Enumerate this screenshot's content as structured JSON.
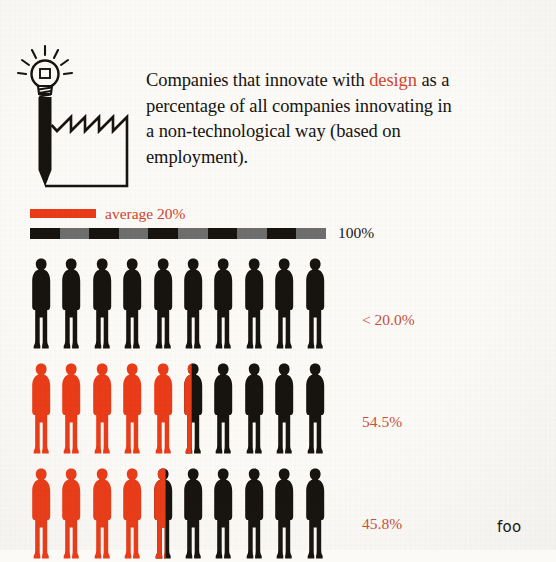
{
  "headline": {
    "part1": "Companies that innovate with ",
    "accent": "design",
    "part2": " as a percentage of all companies innovating in a non-technological way (based on employment)."
  },
  "logo": {
    "icon_name": "lightbulb-pencil-factory-icon"
  },
  "legend": {
    "average_label": "average 20%",
    "total_label": "100%",
    "average_value": 20,
    "total_value": 100,
    "segments": 10
  },
  "colors": {
    "red": "#ea3c18",
    "red_text": "#c8503c",
    "accent_text": "#d4452a",
    "black": "#17130f",
    "gray": "#6e6e6e",
    "paper": "#fbfaf7"
  },
  "cut_off_text": "foo",
  "chart_data": {
    "type": "bar",
    "title": "Companies that innovate with design as a percentage of all companies innovating in a non-technological way (based on employment).",
    "subtitle": "",
    "xlabel": "",
    "ylabel": "",
    "unit": "%",
    "pictogram": {
      "icon": "person",
      "icons_per_row": 10,
      "value_per_icon": 10
    },
    "legend": [
      {
        "name": "average 20%",
        "color": "#ea3c18"
      },
      {
        "name": "100%",
        "color": "#17130f"
      }
    ],
    "xlim": [
      0,
      100
    ],
    "categories": [
      "< 20.0%",
      "54.5%",
      "45.8%"
    ],
    "values": [
      0,
      54.5,
      45.8
    ],
    "rows": [
      {
        "label": "< 20.0%",
        "value": 0,
        "filled_icons": 0,
        "partial_fraction": 0,
        "total_icons": 10
      },
      {
        "label": "54.5%",
        "value": 54.5,
        "filled_icons": 5,
        "partial_fraction": 0.45,
        "total_icons": 10
      },
      {
        "label": "45.8%",
        "value": 45.8,
        "filled_icons": 4,
        "partial_fraction": 0.58,
        "total_icons": 10
      }
    ]
  }
}
